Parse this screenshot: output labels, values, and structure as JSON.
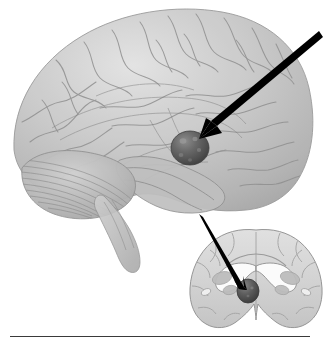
{
  "figure": {
    "kind": "anatomical-illustration",
    "background_color": "#ffffff",
    "canvas": {
      "width": 328,
      "height": 347
    },
    "alt_text": "Lateral view of a semi-transparent human brain with a dark spherical structure highlighted deep in the temporal lobe, indicated by a black arrow from upper right; below right, a coronal brain section shows the same dark structure beneath the lateral ventricles, indicated by a second black arrow."
  },
  "panels": [
    {
      "id": "lateral-brain",
      "name": "Lateral whole-brain view",
      "parts": [
        {
          "name": "cerebral cortex",
          "note": "translucent gray with gyri and sulci"
        },
        {
          "name": "cerebellum",
          "note": "folia striations, lower left"
        },
        {
          "name": "brain stem",
          "note": "descends below cerebellum"
        },
        {
          "name": "temporal lobe",
          "note": "lower central lobe"
        },
        {
          "name": "internal limbic tracts",
          "note": "faint lines seen through translucency"
        },
        {
          "name": "highlighted structure",
          "note": "dark sphere deep to temporal lobe"
        }
      ]
    },
    {
      "id": "coronal-section",
      "name": "Coronal section view",
      "parts": [
        {
          "name": "cerebral hemispheres",
          "note": "cut surface, pale gray"
        },
        {
          "name": "lateral ventricles",
          "note": "white butterfly-shaped cavities"
        },
        {
          "name": "corpus callosum",
          "note": "arching band above ventricles"
        },
        {
          "name": "basal ganglia",
          "note": "gray nuclei lateral to ventricles"
        },
        {
          "name": "highlighted structure",
          "note": "dark sphere at midline base"
        }
      ]
    }
  ],
  "annotations": {
    "arrows": [
      {
        "id": "arrow-to-lateral-structure",
        "name": "pointer arrow to structure in lateral view",
        "from": {
          "x": 318,
          "y": 33
        },
        "to": {
          "x": 201,
          "y": 139
        },
        "color": "#000000"
      },
      {
        "id": "arrow-to-coronal-structure",
        "name": "pointer arrow to structure in coronal section",
        "from": {
          "x": 200,
          "y": 216
        },
        "to": {
          "x": 245,
          "y": 288
        },
        "color": "#000000"
      }
    ],
    "markers": [
      {
        "id": "structure-lateral",
        "name": "highlighted-structure-lateral",
        "center": {
          "x": 190,
          "y": 148
        },
        "radius": 18,
        "color": "#5d5d5d"
      },
      {
        "id": "structure-coronal",
        "name": "highlighted-structure-coronal",
        "center": {
          "x": 248,
          "y": 291
        },
        "radius": 10,
        "color": "#4f4f4f"
      }
    ],
    "caption_rule": {
      "name": "caption-divider-rule",
      "x": 10,
      "y": 336,
      "width": 300,
      "color": "#3a3a3a"
    }
  },
  "palette": {
    "background": "#ffffff",
    "cortex_light": "#dcdcdc",
    "cortex_mid": "#c2c2c2",
    "cortex_shadow": "#a6a6a6",
    "sulcus_line": "#8e8e8e",
    "cerebellum": "#b9b9b9",
    "section_fill": "#d5d5d5",
    "section_outline": "#9a9a9a",
    "ventricle_white": "#fbfbfb",
    "structure_dark": "#565656",
    "structure_highlight": "#8a8a8a",
    "arrow_black": "#000000",
    "rule_line": "#3a3a3a"
  }
}
